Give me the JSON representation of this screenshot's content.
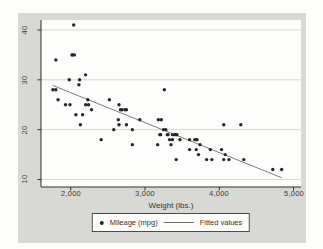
{
  "style": {
    "surround": "#d8d8d4",
    "plot_bg": "#fdfdfb",
    "grid": "#d7d7d4",
    "axis": "#2f2f2f",
    "marker": "#262626",
    "fit_line": "#6e6e6e",
    "text": "#3a3a3a"
  },
  "chart_data": {
    "type": "scatter",
    "title": "",
    "xlabel": "Weight (lbs.)",
    "ylabel": "",
    "xlim": [
      1600,
      5100
    ],
    "ylim": [
      8.5,
      42
    ],
    "x_ticks": [
      2000,
      3000,
      4000,
      5000
    ],
    "x_tick_labels": [
      "2,000",
      "3,000",
      "4,000",
      "5,000"
    ],
    "y_ticks": [
      10,
      20,
      30,
      40
    ],
    "y_tick_labels": [
      "10",
      "20",
      "30",
      "40"
    ],
    "grid": "horizontal-only",
    "legend_position": "bottom-center",
    "series": [
      {
        "name": "Mileage (mpg)",
        "type": "scatter",
        "points": [
          [
            2930,
            22
          ],
          [
            3350,
            17
          ],
          [
            2640,
            22
          ],
          [
            3250,
            20
          ],
          [
            4080,
            15
          ],
          [
            3670,
            18
          ],
          [
            2230,
            26
          ],
          [
            3280,
            20
          ],
          [
            3880,
            16
          ],
          [
            3400,
            19
          ],
          [
            4330,
            14
          ],
          [
            3900,
            14
          ],
          [
            4290,
            21
          ],
          [
            2110,
            29
          ],
          [
            3690,
            16
          ],
          [
            3180,
            22
          ],
          [
            3220,
            22
          ],
          [
            2750,
            24
          ],
          [
            3430,
            19
          ],
          [
            2120,
            30
          ],
          [
            3600,
            18
          ],
          [
            3600,
            16
          ],
          [
            3740,
            17
          ],
          [
            1800,
            28
          ],
          [
            2650,
            21
          ],
          [
            4840,
            12
          ],
          [
            4720,
            12
          ],
          [
            3830,
            14
          ],
          [
            2580,
            20
          ],
          [
            4060,
            14
          ],
          [
            3720,
            15
          ],
          [
            3370,
            18
          ],
          [
            4130,
            14
          ],
          [
            2830,
            20
          ],
          [
            4060,
            21
          ],
          [
            3310,
            19
          ],
          [
            3300,
            19
          ],
          [
            3690,
            18
          ],
          [
            3370,
            19
          ],
          [
            2730,
            24
          ],
          [
            4030,
            16
          ],
          [
            3260,
            28
          ],
          [
            1800,
            34
          ],
          [
            2200,
            25
          ],
          [
            2520,
            26
          ],
          [
            3330,
            18
          ],
          [
            3700,
            18
          ],
          [
            3470,
            18
          ],
          [
            3210,
            19
          ],
          [
            3200,
            19
          ],
          [
            3420,
            19
          ],
          [
            2690,
            24
          ],
          [
            2830,
            17
          ],
          [
            2070,
            23
          ],
          [
            2650,
            25
          ],
          [
            2020,
            35
          ],
          [
            2020,
            35
          ],
          [
            2280,
            24
          ],
          [
            2750,
            21
          ],
          [
            2130,
            21
          ],
          [
            2240,
            25
          ],
          [
            1760,
            28
          ],
          [
            1980,
            30
          ],
          [
            3420,
            14
          ],
          [
            1830,
            26
          ],
          [
            2050,
            35
          ],
          [
            2410,
            18
          ],
          [
            2200,
            31
          ],
          [
            2670,
            24
          ],
          [
            2160,
            23
          ],
          [
            1930,
            25
          ],
          [
            2040,
            41
          ],
          [
            1990,
            25
          ],
          [
            3170,
            17
          ]
        ]
      },
      {
        "name": "Fitted values",
        "type": "line",
        "fit": {
          "intercept": 39.44028,
          "slope": -0.0060087
        },
        "x_range": [
          1760,
          4840
        ]
      }
    ]
  }
}
